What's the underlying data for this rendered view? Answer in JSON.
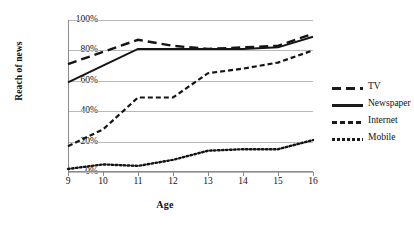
{
  "chart_data": {
    "type": "line",
    "title": "",
    "xlabel": "Age",
    "ylabel": "Reach of news",
    "x": [
      9,
      10,
      11,
      12,
      13,
      14,
      15,
      16
    ],
    "xticklabels": [
      "9",
      "10",
      "11",
      "12",
      "13",
      "14",
      "15",
      "16"
    ],
    "yticklabels": [
      "0%",
      "20%",
      "40%",
      "60%",
      "80%",
      "100%"
    ],
    "ytickvalues": [
      0,
      20,
      40,
      60,
      80,
      100
    ],
    "ylim": [
      0,
      100
    ],
    "xlim": [
      9,
      16
    ],
    "grid": "horizontal",
    "legend_position": "right",
    "series": [
      {
        "name": "TV",
        "style": "long-dash",
        "values": [
          71,
          79,
          87,
          83,
          81,
          82,
          83,
          91
        ]
      },
      {
        "name": "Newspaper",
        "style": "solid",
        "values": [
          59,
          70,
          81,
          81,
          81,
          81,
          82,
          89
        ]
      },
      {
        "name": "Internet",
        "style": "short-dash",
        "values": [
          17,
          28,
          49,
          49,
          65,
          68,
          72,
          80
        ]
      },
      {
        "name": "Mobile",
        "style": "dotted",
        "values": [
          2,
          5,
          4,
          8,
          14,
          15,
          15,
          21
        ]
      }
    ]
  },
  "legend": {
    "items": [
      {
        "label": "TV"
      },
      {
        "label": "Newspaper"
      },
      {
        "label": "Internet"
      },
      {
        "label": "Mobile"
      }
    ]
  }
}
